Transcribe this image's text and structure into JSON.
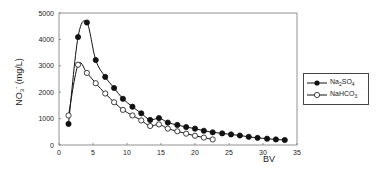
{
  "chart_data": {
    "type": "line",
    "title": "",
    "xlabel": "BV",
    "ylabel": "NO3- (mg/L)",
    "xlim": [
      0,
      35
    ],
    "ylim": [
      0,
      5000
    ],
    "xticks": [
      0,
      5,
      10,
      15,
      20,
      25,
      30,
      35
    ],
    "yticks": [
      0,
      1000,
      2000,
      3000,
      4000,
      5000
    ],
    "grid": false,
    "legend_position": "right",
    "series": [
      {
        "name": "Na2SO4",
        "marker": "filled-circle",
        "x": [
          1.4,
          2.8,
          4.1,
          5.4,
          6.8,
          8.1,
          9.4,
          10.8,
          12.1,
          13.4,
          14.7,
          16.0,
          17.4,
          18.7,
          20.0,
          21.3,
          22.6,
          24.0,
          25.3,
          26.6,
          27.9,
          29.2,
          30.6,
          31.9,
          33.2
        ],
        "y": [
          800,
          4090,
          4640,
          3220,
          2580,
          2160,
          1750,
          1450,
          1200,
          950,
          1020,
          850,
          760,
          680,
          620,
          540,
          480,
          440,
          400,
          360,
          310,
          270,
          240,
          210,
          190
        ]
      },
      {
        "name": "NaHCO3",
        "marker": "open-circle",
        "x": [
          1.4,
          2.8,
          4.1,
          5.4,
          6.8,
          8.1,
          9.4,
          10.8,
          12.1,
          13.4,
          14.7,
          16.0,
          17.4,
          18.7,
          20.0,
          21.3,
          22.6
        ],
        "y": [
          1120,
          3040,
          2730,
          2340,
          1950,
          1620,
          1330,
          1120,
          930,
          720,
          780,
          620,
          520,
          430,
          350,
          280,
          210
        ]
      }
    ]
  },
  "legend": {
    "items": [
      {
        "label_main": "Na",
        "sub1": "2",
        "mid": "SO",
        "sub2": "4"
      },
      {
        "label_main": "NaHCO",
        "sub1": "3",
        "mid": "",
        "sub2": ""
      }
    ]
  },
  "axis": {
    "ylabel_prefix": "NO",
    "ylabel_sub": "3",
    "ylabel_sup": "-",
    "ylabel_suffix": " (mg/L)",
    "xlabel": "BV"
  }
}
